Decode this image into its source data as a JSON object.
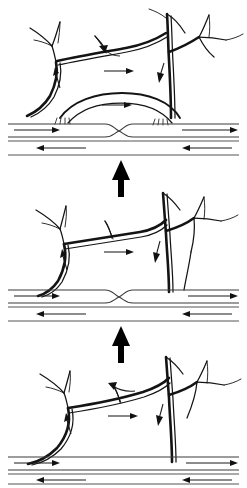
{
  "figure": {
    "background_color": "#ffffff",
    "ink_color": "#141414",
    "panel_count": 3,
    "reading_direction": "bottom-to-top",
    "panels": [
      {
        "id": "panel-top",
        "order_label": "3",
        "stage": "top",
        "features": [
          "branching vessel tree with left and right trunks",
          "arched collateral loop spanning between trunks",
          "hatched tick marks at both arch feet",
          "constricted (pinched) horizontal conduit at center",
          "paired horizontal flow lines above and below conduit"
        ],
        "flow_arrows": [
          {
            "name": "arch-loop-right-arrow",
            "direction": "right"
          },
          {
            "name": "upper-branch-right-arrow",
            "direction": "right"
          },
          {
            "name": "left-trunk-up-arrow",
            "direction": "up"
          },
          {
            "name": "right-trunk-down-arrow",
            "direction": "down"
          },
          {
            "name": "upper-branch-left-arrow",
            "direction": "left"
          },
          {
            "name": "conduit-top-right-arrow",
            "direction": "right"
          },
          {
            "name": "conduit-bottom-left-arrow",
            "direction": "left"
          },
          {
            "name": "conduit-right-segment-arrow",
            "direction": "right"
          }
        ],
        "hatch_marks": {
          "left_group": 4,
          "right_group": 4
        }
      },
      {
        "id": "panel-middle",
        "order_label": "2",
        "stage": "middle",
        "features": [
          "branching vessel tree with left and right trunks",
          "wide flat collateral bridge between trunks",
          "constricted (pinched) horizontal conduit at center",
          "paired horizontal flow lines above and below conduit"
        ],
        "flow_arrows": [
          {
            "name": "bridge-right-arrow",
            "direction": "right"
          },
          {
            "name": "left-trunk-up-arrow",
            "direction": "up"
          },
          {
            "name": "right-trunk-down-arrow",
            "direction": "down"
          },
          {
            "name": "conduit-top-left-arrow",
            "direction": "right"
          },
          {
            "name": "conduit-bottom-left-arrow",
            "direction": "left"
          },
          {
            "name": "conduit-right-top-arrow",
            "direction": "right"
          },
          {
            "name": "conduit-right-mid-arrow",
            "direction": "left"
          }
        ],
        "hatch_marks": {
          "left_group": 0,
          "right_group": 0
        }
      },
      {
        "id": "panel-bottom",
        "order_label": "1",
        "stage": "bottom",
        "features": [
          "branching vessel tree with left and right trunks",
          "sloping collateral bridge between trunks",
          "uninterrupted horizontal conduit (no constriction)",
          "paired horizontal flow lines above and below conduit"
        ],
        "flow_arrows": [
          {
            "name": "bridge-right-arrow",
            "direction": "right"
          },
          {
            "name": "bridge-left-arrow",
            "direction": "left"
          },
          {
            "name": "left-trunk-up-arrow",
            "direction": "up"
          },
          {
            "name": "right-trunk-down-arrow",
            "direction": "down"
          },
          {
            "name": "conduit-top-left-arrow",
            "direction": "right"
          },
          {
            "name": "conduit-bottom-left-arrow",
            "direction": "left"
          },
          {
            "name": "conduit-right-top-arrow",
            "direction": "right"
          },
          {
            "name": "conduit-right-mid-arrow",
            "direction": "left"
          }
        ],
        "hatch_marks": {
          "left_group": 0,
          "right_group": 0
        }
      }
    ],
    "progression_arrows": [
      {
        "id": "arrow-bottom-to-middle",
        "direction": "up",
        "x": 121,
        "y_top": 327,
        "y_bottom": 363
      },
      {
        "id": "arrow-middle-to-top",
        "direction": "up",
        "x": 121,
        "y_top": 161,
        "y_bottom": 197
      }
    ]
  }
}
